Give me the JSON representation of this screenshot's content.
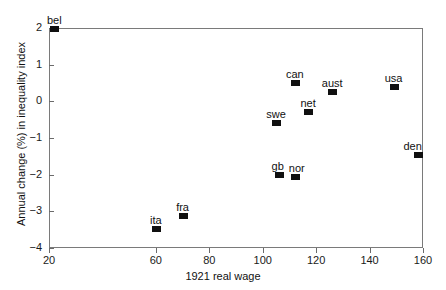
{
  "chart_data": {
    "type": "scatter",
    "title": "",
    "xlabel": "1921 real wage",
    "ylabel": "Annual change (%) in inequality index",
    "xlim": [
      20,
      160
    ],
    "ylim": [
      -4,
      2
    ],
    "xticks": [
      20,
      60,
      80,
      100,
      120,
      140,
      160
    ],
    "xticklabels": [
      "20",
      "60",
      "80",
      "100",
      "120",
      "140",
      "160"
    ],
    "yticks": [
      2,
      1,
      0,
      -1,
      -2,
      -3,
      -4
    ],
    "yticklabels": [
      "2",
      "1",
      "0",
      "−1",
      "−2",
      "−3",
      "−4"
    ],
    "grid": false,
    "legend": null,
    "marker_color": "#101010",
    "marker_style": "filled-square",
    "axis_color": "#7a7a7a",
    "points": [
      {
        "label": "bel",
        "x": 22,
        "y": 1.97,
        "label_dx": 0,
        "label_dy": -14
      },
      {
        "label": "ita",
        "x": 60,
        "y": -3.48,
        "label_dx": 0,
        "label_dy": -14
      },
      {
        "label": "fra",
        "x": 70,
        "y": -3.13,
        "label_dx": 0,
        "label_dy": -14
      },
      {
        "label": "swe",
        "x": 105,
        "y": -0.6,
        "label_dx": 0,
        "label_dy": -14
      },
      {
        "label": "gb",
        "x": 106,
        "y": -2.02,
        "label_dx": -1,
        "label_dy": -14
      },
      {
        "label": "nor",
        "x": 112,
        "y": -2.07,
        "label_dx": 2,
        "label_dy": -14
      },
      {
        "label": "can",
        "x": 112,
        "y": 0.5,
        "label_dx": 0,
        "label_dy": -14
      },
      {
        "label": "net",
        "x": 117,
        "y": -0.3,
        "label_dx": 0,
        "label_dy": -14
      },
      {
        "label": "aust",
        "x": 126,
        "y": 0.25,
        "label_dx": 0,
        "label_dy": -14
      },
      {
        "label": "usa",
        "x": 149,
        "y": 0.38,
        "label_dx": 0,
        "label_dy": -14
      },
      {
        "label": "den",
        "x": 158,
        "y": -1.45,
        "label_dx": -5,
        "label_dy": -14
      }
    ]
  }
}
